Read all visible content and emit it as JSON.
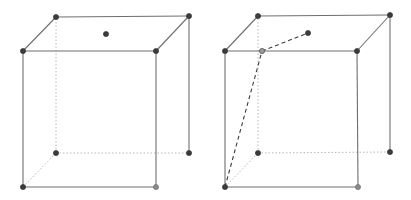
{
  "figures": [
    {
      "name": "cube-left",
      "description": "Cube with a point marked on the top face",
      "vertices": [
        "A",
        "B",
        "C",
        "D",
        "A1",
        "B1",
        "C1",
        "D1"
      ],
      "visible_edges": [
        [
          "A1",
          "B1"
        ],
        [
          "B1",
          "C1"
        ],
        [
          "C1",
          "D1"
        ],
        [
          "D1",
          "A1"
        ],
        [
          "A",
          "B"
        ],
        [
          "A",
          "A1"
        ],
        [
          "B",
          "B1"
        ],
        [
          "C",
          "C1"
        ]
      ],
      "hidden_edges": [
        [
          "A",
          "D"
        ],
        [
          "D",
          "C"
        ],
        [
          "D",
          "D1"
        ]
      ],
      "extra_points": [
        {
          "id": "P",
          "on": "top-face",
          "style": "filled"
        }
      ],
      "gray_vertices": [
        "B"
      ],
      "dashed_segments": []
    },
    {
      "name": "cube-right",
      "description": "Same cube with a dashed polyline from bottom-front-left vertex through a point on the top-front edge to the top-face point",
      "vertices": [
        "A",
        "B",
        "C",
        "D",
        "A1",
        "B1",
        "C1",
        "D1"
      ],
      "visible_edges": [
        [
          "A1",
          "B1"
        ],
        [
          "B1",
          "C1"
        ],
        [
          "C1",
          "D1"
        ],
        [
          "D1",
          "A1"
        ],
        [
          "A",
          "B"
        ],
        [
          "A",
          "A1"
        ],
        [
          "B",
          "B1"
        ],
        [
          "C",
          "C1"
        ]
      ],
      "hidden_edges": [
        [
          "A",
          "D"
        ],
        [
          "D",
          "C"
        ],
        [
          "D",
          "D1"
        ]
      ],
      "extra_points": [
        {
          "id": "P",
          "on": "top-face",
          "style": "filled"
        },
        {
          "id": "Q",
          "on": "edge-A1B1",
          "style": "hollow"
        }
      ],
      "gray_vertices": [
        "B"
      ],
      "dashed_segments": [
        [
          "A",
          "Q"
        ],
        [
          "Q",
          "P"
        ]
      ]
    }
  ],
  "colors": {
    "edge": "#6f6f6f",
    "hidden_edge": "#b8b8b8",
    "vertex": "#3c3c3c",
    "vertex_gray": "#8a8a8a",
    "dashed": "#3a3a3a"
  }
}
